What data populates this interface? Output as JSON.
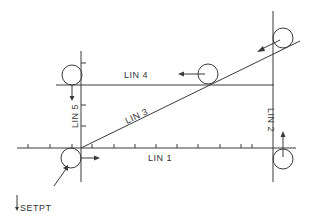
{
  "diagram": {
    "title": "",
    "colors": {
      "line": "#3a3a3a",
      "text": "#333333",
      "background": "#ffffff"
    },
    "lines": [
      {
        "id": "lin1",
        "label": "LIN 1"
      },
      {
        "id": "lin2",
        "label": "LIN 2"
      },
      {
        "id": "lin3",
        "label": "LIN 3"
      },
      {
        "id": "lin4",
        "label": "LIN 4"
      },
      {
        "id": "lin5",
        "label": "LIN 5"
      }
    ],
    "setpoint_label": "SETPT"
  }
}
